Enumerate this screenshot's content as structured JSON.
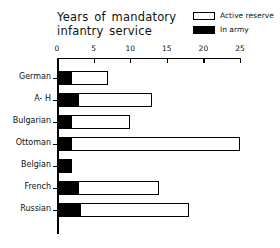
{
  "chart_data": {
    "type": "bar",
    "orientation": "horizontal",
    "stacked": true,
    "title": "Years of mandatory infantry service",
    "title_lines": [
      "Years of  mandatory",
      "infantry  service"
    ],
    "xlabel": "",
    "ylabel": "",
    "xlim": [
      0,
      25
    ],
    "xticks": [
      0,
      5,
      10,
      15,
      20,
      25
    ],
    "xtick_labels": [
      "0",
      "5",
      "10",
      "15",
      "20",
      "25"
    ],
    "grid": false,
    "legend_position": "top-right",
    "categories": [
      "German",
      "A- H",
      "Bulgarian",
      "Ottoman",
      "Belgian",
      "French",
      "Russian"
    ],
    "series": [
      {
        "name": "In army",
        "color": "#000000",
        "values": [
          2,
          3,
          2,
          2,
          2,
          3,
          3.3
        ]
      },
      {
        "name": "Active reserve",
        "color": "#ffffff",
        "values": [
          5,
          10,
          8,
          23,
          0,
          11,
          14.7
        ]
      }
    ],
    "totals": [
      7,
      13,
      10,
      25,
      2,
      14,
      18
    ]
  },
  "legend": {
    "items": [
      {
        "label": "Active reserve",
        "swatch": "hollow"
      },
      {
        "label": "In army",
        "swatch": "filled"
      }
    ]
  }
}
